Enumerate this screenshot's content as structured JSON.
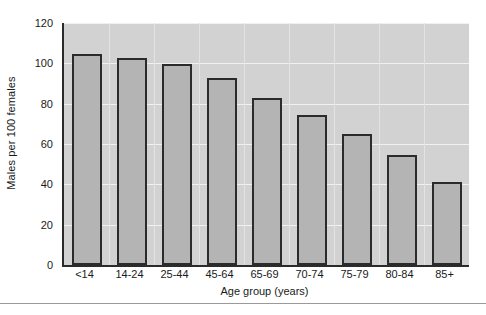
{
  "chart_data": {
    "type": "bar",
    "title": "",
    "subtitle": "",
    "xlabel": "Age group (years)",
    "ylabel": "Males per 100 females",
    "categories": [
      "<14",
      "14-24",
      "25-44",
      "45-64",
      "65-69",
      "70-74",
      "75-79",
      "80-84",
      "85+"
    ],
    "values": [
      104.5,
      102.5,
      99.5,
      92.5,
      83,
      74.5,
      65,
      54.5,
      41
    ],
    "ylim": [
      0,
      120
    ],
    "yticks": [
      0,
      20,
      40,
      60,
      80,
      100,
      120
    ],
    "ytick_labels": [
      "0",
      "20",
      "40",
      "60",
      "80",
      "100",
      "120"
    ],
    "grid": "horizontal",
    "legend": "none",
    "series": [
      {
        "name": "Males per 100 females",
        "values": [
          104.5,
          102.5,
          99.5,
          92.5,
          83,
          74.5,
          65,
          54.5,
          41
        ]
      }
    ]
  },
  "style": {
    "plot_background": "#d2d2d2",
    "bar_fill": "#b4b4b4",
    "bar_edge": "#2b2b2b",
    "gridline_color": "#f1f1f1",
    "axis_color": "#2b2b2b",
    "text_color": "#1a1a1a",
    "page_background": "#ffffff"
  }
}
